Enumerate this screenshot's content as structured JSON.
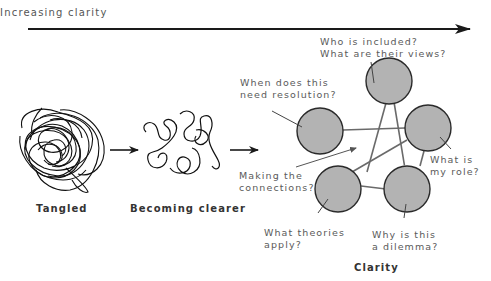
{
  "header": {
    "axis_label": "Increasing clarity"
  },
  "stages": [
    {
      "id": "tangled",
      "caption": "Tangled"
    },
    {
      "id": "becoming-clearer",
      "caption": "Becoming clearer"
    },
    {
      "id": "clarity",
      "caption": "Clarity"
    }
  ],
  "clarity_nodes": {
    "top": "Who is included?\nWhat are their views?",
    "left": "When does this\nneed resolution?",
    "right": "What is\nmy role?",
    "bottom_left": "What theories\napply?",
    "bottom_right": "Why is this\na dilemma?",
    "center": "Making the\nconnections?"
  },
  "colors": {
    "node_fill": "#b3b3b3",
    "node_stroke": "#2a2a2a",
    "edge": "#6a6a6a",
    "arrow": "#1a1a1a",
    "label_text": "#5a5a5a"
  }
}
